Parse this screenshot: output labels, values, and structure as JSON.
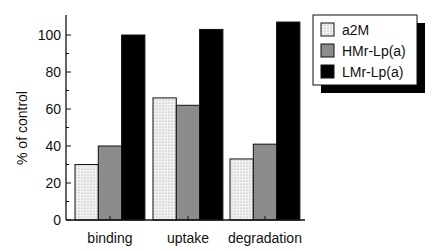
{
  "chart_data": {
    "type": "bar",
    "title": "",
    "xlabel": "",
    "ylabel": "% of control",
    "ylim": [
      0,
      110
    ],
    "yticks": [
      0,
      20,
      40,
      60,
      80,
      100
    ],
    "ytick_labels": [
      "0",
      "20",
      "40",
      "60",
      "80",
      "100"
    ],
    "grid": false,
    "legend_position": "top-right",
    "categories": [
      "binding",
      "uptake",
      "degradation"
    ],
    "series": [
      {
        "name": "a2M",
        "values": [
          30,
          66,
          33
        ],
        "fill": "dotted-light",
        "color": "#e6e6e6"
      },
      {
        "name": "HMr-Lp(a)",
        "values": [
          40,
          62,
          41
        ],
        "fill": "gray",
        "color": "#8c8c8c"
      },
      {
        "name": "LMr-Lp(a)",
        "values": [
          100,
          103,
          107
        ],
        "fill": "black",
        "color": "#000000"
      }
    ]
  }
}
